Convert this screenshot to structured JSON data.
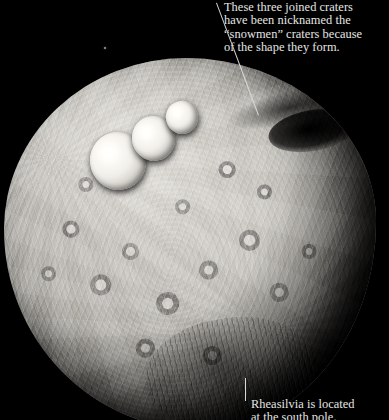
{
  "image": {
    "subject": "asteroid-vesta",
    "background_color": "#000000",
    "width": 389,
    "height": 420
  },
  "annotations": {
    "top": {
      "text": "These three joined craters\nhave been nicknamed the\n“snowmen” craters because\nof the shape they form.",
      "color": "#e6e6e4",
      "leader": "diagonal-line-to-snowmen-craters"
    },
    "bottom": {
      "text": "Rheasilvia is located\nat the south pole.",
      "color": "#e6e6e4",
      "leader": "vertical-line-to-south-pole"
    }
  },
  "features": {
    "snowmen_craters": [
      "crater-large",
      "crater-medium",
      "crater-small"
    ],
    "dark_band": "shadowed-crater-region",
    "south_pole": "rheasilvia-basin",
    "star": "background-star"
  }
}
